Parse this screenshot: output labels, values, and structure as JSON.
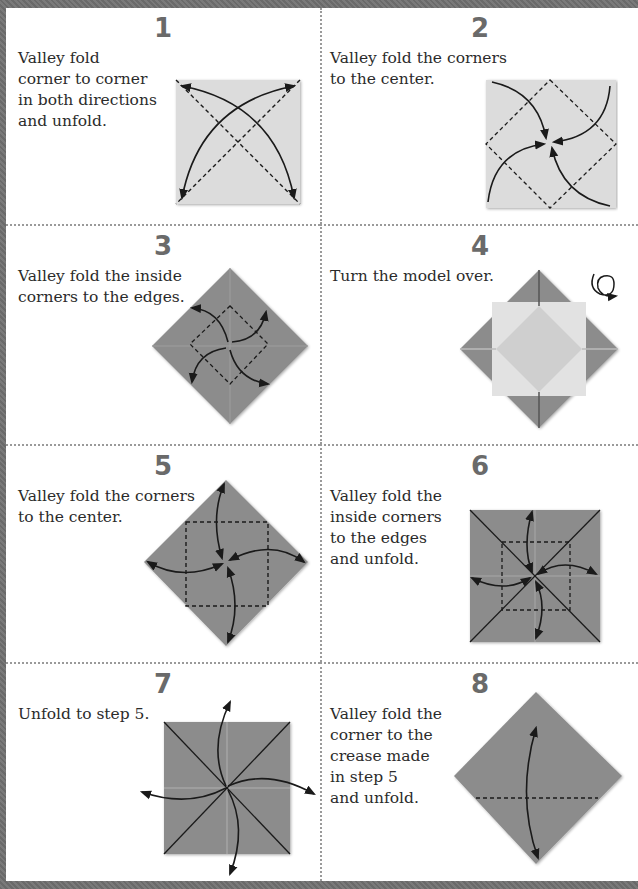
{
  "colors": {
    "paper_light": "#dcdcdc",
    "paper_dark": "#8c8c8c",
    "line": "#1a1a1a",
    "number": "#6a6a6a",
    "text": "#2b2b2b",
    "divider": "#9a9a9a"
  },
  "steps": [
    {
      "number": "1",
      "text": "Valley fold\ncorner to corner\nin both directions\nand unfold.",
      "diagram": "square-diagonal-creases-icon"
    },
    {
      "number": "2",
      "text": "Valley fold the corners\nto the center.",
      "diagram": "square-corners-to-center-icon"
    },
    {
      "number": "3",
      "text": "Valley fold the inside\ncorners to the edges.",
      "diagram": "diamond-inside-corners-icon"
    },
    {
      "number": "4",
      "text": "Turn the model over.",
      "diagram": "turn-over-icon"
    },
    {
      "number": "5",
      "text": "Valley fold the corners\nto the center.",
      "diagram": "diamond-corners-to-center-icon"
    },
    {
      "number": "6",
      "text": "Valley fold the\ninside corners\nto the edges\nand unfold.",
      "diagram": "square-inside-corners-unfold-icon"
    },
    {
      "number": "7",
      "text": "Unfold to step 5.",
      "diagram": "square-unfold-icon"
    },
    {
      "number": "8",
      "text": "Valley fold the\ncorner to the\ncrease made\nin step 5\nand unfold.",
      "diagram": "diamond-corner-to-crease-icon"
    }
  ]
}
